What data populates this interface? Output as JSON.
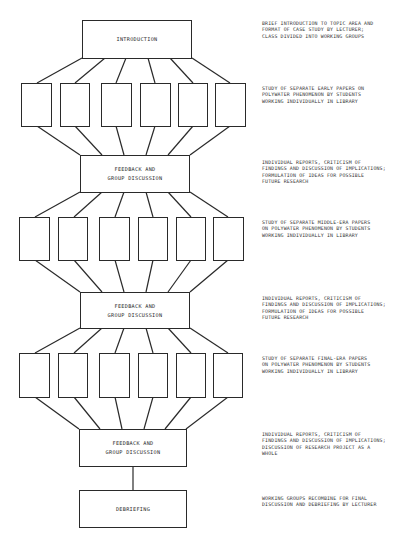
{
  "diagram": {
    "stages": [
      {
        "id": "intro",
        "label": "INTRODUCTION",
        "note": "BRIEF INTRODUCTION TO TOPIC AREA AND\nFORMAT OF CASE STUDY BY LECTURER;\nCLASS DIVIDED INTO WORKING GROUPS"
      },
      {
        "id": "study1",
        "label": "",
        "note": "STUDY OF SEPARATE EARLY PAPERS ON\nPOLYWATER PHENOMENON BY STUDENTS\nWORKING INDIVIDUALLY IN LIBRARY",
        "box_count": 6
      },
      {
        "id": "feedback1",
        "label_line1": "FEEDBACK AND",
        "label_line2": "GROUP DISCUSSION",
        "note": "INDIVIDUAL REPORTS, CRITICISM OF\nFINDINGS AND DISCUSSION OF IMPLICATIONS;\nFORMULATION OF IDEAS FOR POSSIBLE\nFUTURE RESEARCH"
      },
      {
        "id": "study2",
        "label": "",
        "note": "STUDY OF SEPARATE MIDDLE-ERA PAPERS\nON POLYWATER PHENOMENON BY STUDENTS\nWORKING INDIVIDUALLY IN LIBRARY",
        "box_count": 6
      },
      {
        "id": "feedback2",
        "label_line1": "FEEDBACK AND",
        "label_line2": "GROUP DISCUSSION",
        "note": "INDIVIDUAL REPORTS, CRITICISM OF\nFINDINGS AND DISCUSSION OF IMPLICATIONS;\nFORMULATION OF IDEAS FOR POSSIBLE\nFUTURE RESEARCH"
      },
      {
        "id": "study3",
        "label": "",
        "note": "STUDY OF SEPARATE FINAL-ERA PAPERS\nON POLYWATER PHENOMENON BY STUDENTS\nWORKING INDIVIDUALLY IN LIBRARY",
        "box_count": 6
      },
      {
        "id": "feedback3",
        "label_line1": "FEEDBACK AND",
        "label_line2": "GROUP DISCUSSION",
        "note": "INDIVIDUAL REPORTS, CRITICISM OF\nFINDINGS AND DISCUSSION OF IMPLICATIONS;\nDISCUSSION OF RESEARCH PROJECT AS A\nWHOLE"
      },
      {
        "id": "debrief",
        "label": "DEBRIEFING",
        "note": "WORKING GROUPS RECOMBINE FOR FINAL\nDISCUSSION AND DEBRIEFING BY LECTURER"
      }
    ]
  },
  "colors": {
    "line": "#2a2a2a",
    "background": "#ffffff"
  }
}
